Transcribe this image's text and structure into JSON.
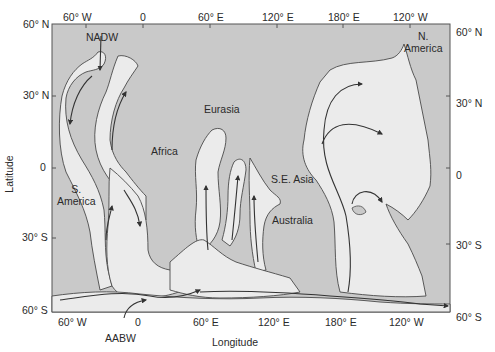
{
  "diagram": {
    "type": "deep ocean circulation map",
    "axes": {
      "x_title": "Longitude",
      "y_title": "Latitude",
      "top_ticks": [
        "60° W",
        "0",
        "60° E",
        "120° E",
        "180° E",
        "120° W"
      ],
      "bottom_ticks": [
        "60° W",
        "0",
        "60° E",
        "120° E",
        "180° E",
        "120° W"
      ],
      "left_ticks": [
        "60° N",
        "30° N",
        "0",
        "30° S",
        "60° S"
      ],
      "right_ticks": [
        "60° N",
        "30° N",
        "0",
        "30° S",
        "60° S"
      ]
    },
    "regions": {
      "north_america": "N.\nAmerica",
      "south_america": "S.\nAmerica",
      "eurasia": "Eurasia",
      "africa": "Africa",
      "se_asia": "S.E. Asia",
      "australia": "Australia"
    },
    "water_masses": {
      "nadw": "NADW",
      "aabw": "AABW"
    },
    "colors": {
      "land": "#c9c9c9",
      "deep_water": "#ebebeb",
      "outline": "#4a4a4a",
      "flow_arrow": "#333333"
    }
  }
}
